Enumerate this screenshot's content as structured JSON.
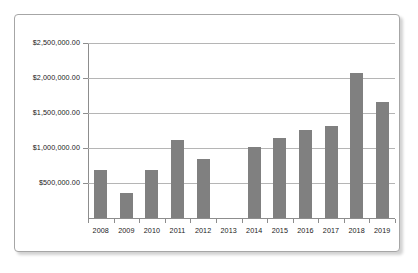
{
  "chart_data": {
    "type": "bar",
    "title": "",
    "subtitle": "",
    "xlabel": "",
    "ylabel": "",
    "categories": [
      "2008",
      "2009",
      "2010",
      "2011",
      "2012",
      "2013",
      "2014",
      "2015",
      "2016",
      "2017",
      "2018",
      "2019"
    ],
    "values": [
      690000,
      360000,
      680000,
      1110000,
      840000,
      null,
      1010000,
      1140000,
      1260000,
      1320000,
      2070000,
      1660000
    ],
    "ylim": [
      0,
      2500000
    ],
    "ytick_values": [
      500000,
      1000000,
      1500000,
      2000000,
      2500000
    ],
    "ytick_labels": [
      "$500,000.00",
      "$1,000,000.00",
      "$1,500,000.00",
      "$2,000,000.00",
      "$2,500,000.00"
    ],
    "grid": true,
    "grid_axis": "y",
    "legend": false,
    "legend_position": "none",
    "series": [
      {
        "name": "",
        "color": "#808080",
        "values": [
          690000,
          360000,
          680000,
          1110000,
          840000,
          null,
          1010000,
          1140000,
          1260000,
          1320000,
          2070000,
          1660000
        ]
      }
    ]
  },
  "style": {
    "bar_color": "#808080",
    "grid_color": "#b5b5b5",
    "axis_color": "#8d8d8d",
    "frame_border_color": "#a6a6a6",
    "text_color": "#1a1a1a",
    "background": "#ffffff"
  }
}
